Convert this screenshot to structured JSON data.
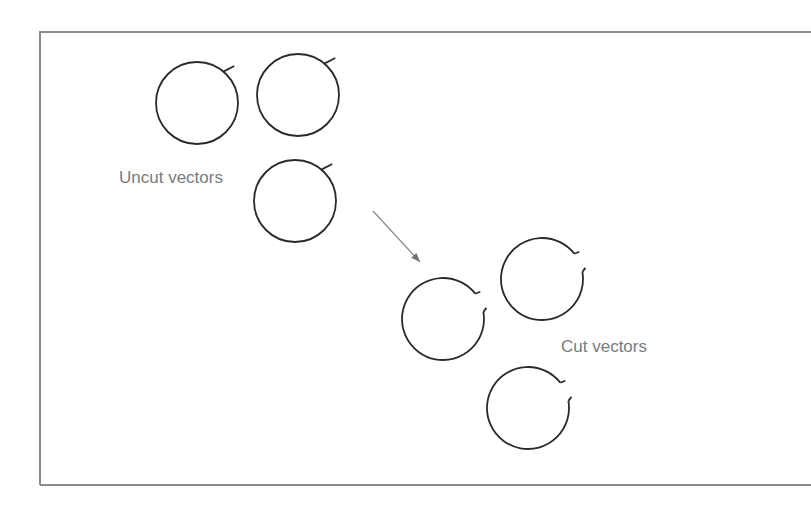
{
  "labels": {
    "uncut": "Uncut vectors",
    "cut": "Cut vectors"
  },
  "colors": {
    "stroke": "#2a2a2a",
    "frame": "#8a8a8a",
    "arrow": "#8c8c8c",
    "label": "#7a7a7a"
  },
  "uncut_vectors": [
    {
      "cx": 197,
      "cy": 103,
      "r": 41
    },
    {
      "cx": 298,
      "cy": 95,
      "r": 41
    },
    {
      "cx": 295,
      "cy": 201,
      "r": 41
    }
  ],
  "cut_vectors": [
    {
      "cx": 443,
      "cy": 319,
      "r": 41
    },
    {
      "cx": 542,
      "cy": 279,
      "r": 41
    },
    {
      "cx": 528,
      "cy": 408,
      "r": 41
    }
  ],
  "arrow": {
    "x1": 373,
    "y1": 211,
    "x2": 420,
    "y2": 262
  }
}
